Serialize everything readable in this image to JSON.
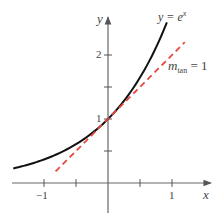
{
  "chart_data": {
    "type": "line",
    "title": "",
    "xlabel": "x",
    "ylabel": "y",
    "xlim": [
      -1.5,
      1.5
    ],
    "ylim": [
      -0.45,
      2.6
    ],
    "grid": false,
    "x_ticks": [
      -1,
      -0.5,
      0.5,
      1
    ],
    "x_tick_labels": [
      "−1",
      "",
      "",
      "1"
    ],
    "y_ticks": [
      0.5,
      1,
      1.5,
      2
    ],
    "y_tick_labels": [
      "",
      "1",
      "",
      "2"
    ],
    "series": [
      {
        "name": "y = e^x",
        "style": "solid",
        "color": "#111111",
        "function": "exp(x)",
        "x_range": [
          -1.48,
          0.92
        ],
        "x": [
          -1.48,
          -1.0,
          -0.5,
          0.0,
          0.5,
          0.92
        ],
        "y": [
          0.228,
          0.368,
          0.607,
          1.0,
          1.649,
          2.509
        ]
      },
      {
        "name": "m_tan = 1",
        "style": "dashed",
        "color": "#e8483f",
        "function": "x + 1",
        "x_range": [
          -0.82,
          1.2
        ],
        "x": [
          -0.82,
          0.0,
          1.2
        ],
        "y": [
          0.18,
          1.0,
          2.2
        ]
      }
    ],
    "annotations": [
      {
        "text": "y = e^x",
        "near": "top of curve"
      },
      {
        "text": "m_tan = 1",
        "near": "tangent line, right side"
      }
    ]
  },
  "labels": {
    "x_axis": "x",
    "y_axis": "y",
    "tick_x_neg1": "−1",
    "tick_x_1": "1",
    "tick_y_1": "1",
    "tick_y_2": "2",
    "curve_label_lhs": "y = e",
    "curve_label_exp": "x",
    "tangent_label_m": "m",
    "tangent_label_sub": "tan",
    "tangent_label_rhs": " = 1"
  },
  "colors": {
    "axis": "#555555",
    "curve": "#111111",
    "tangent": "#e8483f"
  }
}
